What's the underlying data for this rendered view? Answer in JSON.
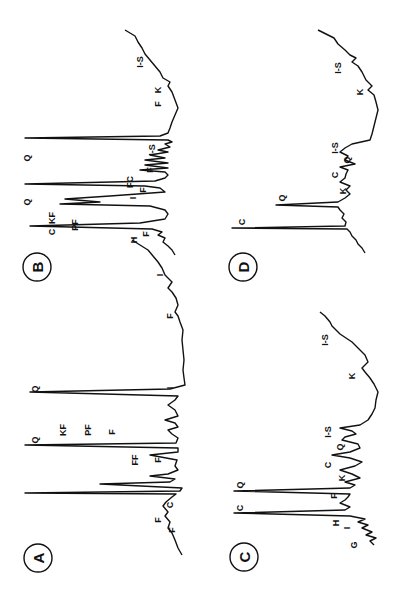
{
  "figure": {
    "rotation_deg": -90,
    "ink_color": "#111111",
    "background": "#ffffff"
  },
  "chart_data": [
    {
      "type": "line",
      "panel": "A",
      "title": "A",
      "xlabel": "",
      "ylabel": "",
      "grid": false,
      "orientation": "rotated 90° counter-clockwise (x-axis runs bottom→top)",
      "trace": [
        [
          555,
          182
        ],
        [
          548,
          178
        ],
        [
          540,
          175
        ],
        [
          533,
          172
        ],
        [
          528,
          168
        ],
        [
          522,
          170
        ],
        [
          516,
          165
        ],
        [
          512,
          168
        ],
        [
          506,
          163
        ],
        [
          502,
          166
        ],
        [
          497,
          172
        ],
        [
          494,
          176
        ],
        [
          493,
          25
        ],
        [
          491,
          180
        ],
        [
          488,
          182
        ],
        [
          484,
          100
        ],
        [
          482,
          170
        ],
        [
          479,
          175
        ],
        [
          476,
          150
        ],
        [
          474,
          168
        ],
        [
          470,
          178
        ],
        [
          466,
          175
        ],
        [
          460,
          177
        ],
        [
          455,
          150
        ],
        [
          452,
          178
        ],
        [
          448,
          178
        ],
        [
          445,
          25
        ],
        [
          443,
          176
        ],
        [
          438,
          178
        ],
        [
          434,
          172
        ],
        [
          430,
          168
        ],
        [
          427,
          178
        ],
        [
          423,
          175
        ],
        [
          420,
          165
        ],
        [
          416,
          178
        ],
        [
          410,
          175
        ],
        [
          405,
          168
        ],
        [
          400,
          175
        ],
        [
          396,
          178
        ],
        [
          392,
          30
        ],
        [
          389,
          170
        ],
        [
          385,
          185
        ],
        [
          378,
          184
        ],
        [
          370,
          183
        ],
        [
          360,
          184
        ],
        [
          350,
          183
        ],
        [
          340,
          182
        ],
        [
          330,
          183
        ],
        [
          322,
          180
        ],
        [
          316,
          178
        ],
        [
          312,
          175
        ],
        [
          305,
          178
        ],
        [
          298,
          176
        ],
        [
          292,
          172
        ],
        [
          288,
          168
        ],
        [
          282,
          172
        ],
        [
          275,
          165
        ],
        [
          268,
          162
        ],
        [
          262,
          158
        ],
        [
          256,
          153
        ],
        [
          250,
          148
        ],
        [
          245,
          140
        ],
        [
          240,
          132
        ]
      ],
      "peak_labels": [
        {
          "text": "Q",
          "x": 35,
          "y": 440
        },
        {
          "text": "Q",
          "x": 35,
          "y": 389
        },
        {
          "text": "KF",
          "x": 63,
          "y": 430
        },
        {
          "text": "PF",
          "x": 88,
          "y": 430
        },
        {
          "text": "F",
          "x": 112,
          "y": 432
        },
        {
          "text": "FF",
          "x": 135,
          "y": 460
        },
        {
          "text": "F",
          "x": 158,
          "y": 460
        },
        {
          "text": "I",
          "x": 170,
          "y": 388
        },
        {
          "text": "F",
          "x": 170,
          "y": 316
        },
        {
          "text": "I",
          "x": 160,
          "y": 275
        },
        {
          "text": "F",
          "x": 158,
          "y": 520
        },
        {
          "text": "F",
          "x": 172,
          "y": 530
        },
        {
          "text": "C",
          "x": 170,
          "y": 505
        }
      ]
    },
    {
      "type": "line",
      "panel": "B",
      "title": "B",
      "xlabel": "",
      "ylabel": "",
      "grid": false,
      "orientation": "rotated 90° counter-clockwise (x-axis runs bottom→top)",
      "trace": [
        [
          255,
          175
        ],
        [
          250,
          172
        ],
        [
          246,
          168
        ],
        [
          242,
          163
        ],
        [
          238,
          165
        ],
        [
          235,
          158
        ],
        [
          232,
          162
        ],
        [
          229,
          152
        ],
        [
          226,
          30
        ],
        [
          223,
          140
        ],
        [
          219,
          165
        ],
        [
          214,
          168
        ],
        [
          210,
          165
        ],
        [
          206,
          150
        ],
        [
          204,
          60
        ],
        [
          202,
          100
        ],
        [
          199,
          65
        ],
        [
          196,
          110
        ],
        [
          192,
          165
        ],
        [
          188,
          160
        ],
        [
          186,
          145
        ],
        [
          184,
          25
        ],
        [
          181,
          155
        ],
        [
          178,
          165
        ],
        [
          175,
          168
        ],
        [
          172,
          165
        ],
        [
          170,
          140
        ],
        [
          168,
          168
        ],
        [
          165,
          145
        ],
        [
          163,
          168
        ],
        [
          160,
          145
        ],
        [
          158,
          165
        ],
        [
          155,
          150
        ],
        [
          152,
          168
        ],
        [
          150,
          158
        ],
        [
          147,
          170
        ],
        [
          144,
          165
        ],
        [
          142,
          172
        ],
        [
          140,
          168
        ],
        [
          138,
          25
        ],
        [
          136,
          160
        ],
        [
          133,
          168
        ],
        [
          128,
          170
        ],
        [
          122,
          172
        ],
        [
          115,
          175
        ],
        [
          108,
          178
        ],
        [
          100,
          175
        ],
        [
          92,
          172
        ],
        [
          86,
          168
        ],
        [
          82,
          170
        ],
        [
          78,
          163
        ],
        [
          72,
          160
        ],
        [
          66,
          155
        ],
        [
          60,
          150
        ],
        [
          54,
          145
        ],
        [
          48,
          142
        ],
        [
          42,
          138
        ],
        [
          36,
          135
        ],
        [
          30,
          125
        ]
      ],
      "peak_labels": [
        {
          "text": "Q",
          "x": 27,
          "y": 202
        },
        {
          "text": "Q",
          "x": 27,
          "y": 158
        },
        {
          "text": "C",
          "x": 52,
          "y": 232
        },
        {
          "text": "KF",
          "x": 52,
          "y": 218
        },
        {
          "text": "PF",
          "x": 75,
          "y": 225
        },
        {
          "text": "H",
          "x": 134,
          "y": 240
        },
        {
          "text": "F",
          "x": 146,
          "y": 234
        },
        {
          "text": "I",
          "x": 133,
          "y": 198
        },
        {
          "text": "F",
          "x": 143,
          "y": 190
        },
        {
          "text": "FC",
          "x": 130,
          "y": 182
        },
        {
          "text": "F",
          "x": 150,
          "y": 170
        },
        {
          "text": "I-S",
          "x": 152,
          "y": 150
        },
        {
          "text": "F",
          "x": 158,
          "y": 104
        },
        {
          "text": "K",
          "x": 158,
          "y": 90
        },
        {
          "text": "I-S",
          "x": 140,
          "y": 62
        }
      ]
    },
    {
      "type": "line",
      "panel": "C",
      "title": "C",
      "xlabel": "",
      "ylabel": "",
      "grid": false,
      "orientation": "rotated 90° counter-clockwise (x-axis runs bottom→top)",
      "trace": [
        [
          545,
          374
        ],
        [
          541,
          370
        ],
        [
          538,
          376
        ],
        [
          535,
          366
        ],
        [
          532,
          372
        ],
        [
          528,
          362
        ],
        [
          525,
          368
        ],
        [
          522,
          358
        ],
        [
          519,
          365
        ],
        [
          516,
          350
        ],
        [
          513,
          234
        ],
        [
          510,
          345
        ],
        [
          507,
          350
        ],
        [
          503,
          340
        ],
        [
          500,
          345
        ],
        [
          497,
          348
        ],
        [
          494,
          350
        ],
        [
          491,
          234
        ],
        [
          488,
          350
        ],
        [
          485,
          355
        ],
        [
          482,
          345
        ],
        [
          478,
          360
        ],
        [
          474,
          352
        ],
        [
          470,
          340
        ],
        [
          466,
          355
        ],
        [
          462,
          362
        ],
        [
          458,
          350
        ],
        [
          455,
          332
        ],
        [
          452,
          350
        ],
        [
          448,
          360
        ],
        [
          444,
          358
        ],
        [
          440,
          342
        ],
        [
          437,
          345
        ],
        [
          434,
          356
        ],
        [
          431,
          352
        ],
        [
          428,
          340
        ],
        [
          425,
          360
        ],
        [
          420,
          368
        ],
        [
          414,
          372
        ],
        [
          408,
          375
        ],
        [
          400,
          376
        ],
        [
          392,
          378
        ],
        [
          384,
          374
        ],
        [
          378,
          370
        ],
        [
          372,
          365
        ],
        [
          368,
          362
        ],
        [
          362,
          368
        ],
        [
          355,
          365
        ],
        [
          348,
          358
        ],
        [
          342,
          352
        ],
        [
          338,
          346
        ],
        [
          334,
          340
        ],
        [
          330,
          336
        ],
        [
          326,
          332
        ],
        [
          322,
          330
        ],
        [
          316,
          325
        ],
        [
          312,
          320
        ]
      ],
      "peak_labels": [
        {
          "text": "C",
          "x": 240,
          "y": 508
        },
        {
          "text": "Q",
          "x": 240,
          "y": 485
        },
        {
          "text": "G",
          "x": 354,
          "y": 545
        },
        {
          "text": "I",
          "x": 347,
          "y": 528
        },
        {
          "text": "H",
          "x": 336,
          "y": 523
        },
        {
          "text": "F",
          "x": 334,
          "y": 496
        },
        {
          "text": "K",
          "x": 342,
          "y": 478
        },
        {
          "text": "C",
          "x": 328,
          "y": 465
        },
        {
          "text": "Q",
          "x": 340,
          "y": 447
        },
        {
          "text": "I-S",
          "x": 328,
          "y": 432
        },
        {
          "text": "K",
          "x": 352,
          "y": 376
        },
        {
          "text": "I-S",
          "x": 325,
          "y": 340
        }
      ]
    },
    {
      "type": "line",
      "panel": "D",
      "title": "D",
      "xlabel": "",
      "ylabel": "",
      "grid": false,
      "orientation": "rotated 90° counter-clockwise (x-axis runs bottom→top)",
      "trace": [
        [
          253,
          365
        ],
        [
          248,
          362
        ],
        [
          244,
          358
        ],
        [
          240,
          356
        ],
        [
          236,
          352
        ],
        [
          232,
          350
        ],
        [
          229,
          347
        ],
        [
          228,
          232
        ],
        [
          226,
          345
        ],
        [
          222,
          346
        ],
        [
          218,
          342
        ],
        [
          214,
          344
        ],
        [
          210,
          340
        ],
        [
          207,
          338
        ],
        [
          205,
          276
        ],
        [
          202,
          338
        ],
        [
          198,
          345
        ],
        [
          194,
          350
        ],
        [
          190,
          346
        ],
        [
          186,
          350
        ],
        [
          182,
          340
        ],
        [
          178,
          345
        ],
        [
          174,
          346
        ],
        [
          170,
          348
        ],
        [
          167,
          340
        ],
        [
          164,
          355
        ],
        [
          160,
          345
        ],
        [
          156,
          348
        ],
        [
          152,
          340
        ],
        [
          148,
          345
        ],
        [
          144,
          352
        ],
        [
          140,
          370
        ],
        [
          134,
          372
        ],
        [
          126,
          374
        ],
        [
          118,
          376
        ],
        [
          110,
          378
        ],
        [
          102,
          376
        ],
        [
          95,
          374
        ],
        [
          90,
          368
        ],
        [
          86,
          372
        ],
        [
          80,
          366
        ],
        [
          72,
          362
        ],
        [
          66,
          358
        ],
        [
          62,
          352
        ],
        [
          58,
          356
        ],
        [
          55,
          350
        ],
        [
          50,
          345
        ],
        [
          44,
          338
        ],
        [
          38,
          334
        ],
        [
          30,
          318
        ]
      ],
      "peak_labels": [
        {
          "text": "C",
          "x": 242,
          "y": 222
        },
        {
          "text": "Q",
          "x": 282,
          "y": 198
        },
        {
          "text": "K",
          "x": 343,
          "y": 191
        },
        {
          "text": "C",
          "x": 335,
          "y": 175
        },
        {
          "text": "Q",
          "x": 347,
          "y": 160
        },
        {
          "text": "I-S",
          "x": 335,
          "y": 148
        },
        {
          "text": "K",
          "x": 360,
          "y": 92
        },
        {
          "text": "I-S",
          "x": 338,
          "y": 68
        }
      ]
    }
  ],
  "panels": [
    {
      "id": "A",
      "label": "A",
      "cx": 38,
      "cy": 558
    },
    {
      "id": "B",
      "label": "B",
      "cx": 37,
      "cy": 267
    },
    {
      "id": "C",
      "label": "C",
      "cx": 244,
      "cy": 557
    },
    {
      "id": "D",
      "label": "D",
      "cx": 243,
      "cy": 267
    }
  ]
}
